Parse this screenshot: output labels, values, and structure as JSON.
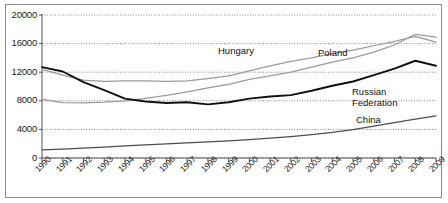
{
  "chart_data": {
    "type": "line",
    "title": "",
    "xlabel": "",
    "ylabel": "",
    "ylim": [
      0,
      20000
    ],
    "ytick_values": [
      0,
      4000,
      8000,
      12000,
      16000,
      20000
    ],
    "ytick_labels": [
      "0",
      "4000",
      "8000",
      "12000",
      "16000",
      "20000"
    ],
    "grid": true,
    "grid_style": "dotted-horizontal",
    "legend_position": "inline-labels",
    "categories": [
      "1990",
      "1991",
      "1992",
      "1993",
      "1994",
      "1995",
      "1996",
      "1997",
      "1998",
      "1999",
      "2000",
      "2001",
      "2002",
      "2003",
      "2004",
      "2005",
      "2006",
      "2007",
      "2008",
      "2009"
    ],
    "series": [
      {
        "name": "Hungary",
        "color": "#9a9a9a",
        "label_x": 218,
        "label_y": 45,
        "values": [
          12400,
          11600,
          10900,
          10700,
          10800,
          10800,
          10700,
          10800,
          11100,
          11500,
          12200,
          12900,
          13500,
          14000,
          14600,
          15100,
          15700,
          16300,
          17000,
          16200
        ]
      },
      {
        "name": "Poland",
        "color": "#9a9a9a",
        "label_x": 318,
        "label_y": 47,
        "values": [
          8200,
          7750,
          7700,
          7800,
          8000,
          8350,
          8750,
          9250,
          9800,
          10300,
          11000,
          11500,
          12000,
          12700,
          13400,
          14000,
          14800,
          15800,
          17300,
          16900
        ]
      },
      {
        "name": "Russian Federation",
        "color": "#111111",
        "label_x": 352,
        "label_y": 86,
        "values": [
          12700,
          12100,
          10600,
          9500,
          8300,
          7900,
          7700,
          7800,
          7500,
          7800,
          8300,
          8600,
          8800,
          9400,
          10100,
          10700,
          11600,
          12500,
          13600,
          12900
        ]
      },
      {
        "name": "China",
        "color": "#4d4d4d",
        "label_x": 356,
        "label_y": 114,
        "values": [
          1150,
          1250,
          1380,
          1520,
          1680,
          1830,
          1980,
          2120,
          2250,
          2400,
          2580,
          2780,
          3000,
          3280,
          3600,
          3980,
          4450,
          4950,
          5450,
          5900
        ]
      }
    ]
  }
}
